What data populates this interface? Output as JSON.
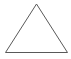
{
  "canvas": {
    "width": 71,
    "height": 59,
    "background_color": "#ffffff",
    "label": "geometric-figure-canvas"
  },
  "figure": {
    "name": "triangle",
    "shape_type": "triangle",
    "stroke_color": "#595959",
    "stroke_width": 1,
    "fill": "none",
    "vertices": [
      {
        "name": "apex",
        "x": 36.5,
        "y": 4.0
      },
      {
        "name": "bottom-left",
        "x": 5.5,
        "y": 52.5
      },
      {
        "name": "bottom-right",
        "x": 67.5,
        "y": 52.5
      }
    ],
    "points_attr": "36.5,4 5.5,52.5 67.5,52.5"
  }
}
